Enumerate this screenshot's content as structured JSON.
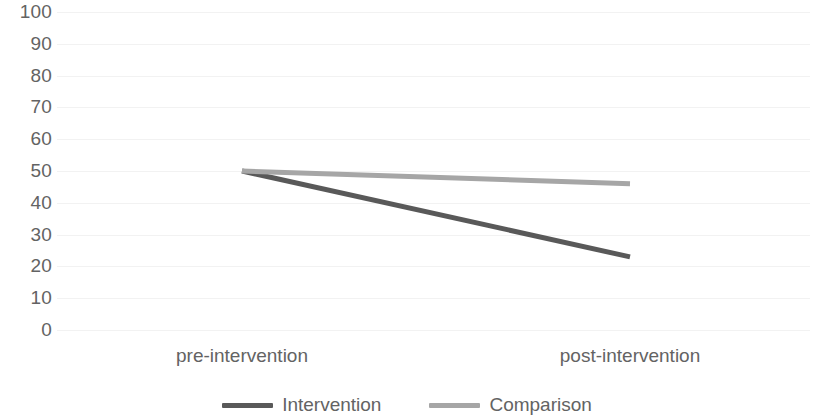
{
  "chart_data": {
    "type": "line",
    "title": "",
    "subtitle": "",
    "xlabel": "",
    "ylabel": "",
    "categories": [
      "pre-intervention",
      "post-intervention"
    ],
    "ylim": [
      0,
      100
    ],
    "y_ticks": [
      100,
      90,
      80,
      70,
      60,
      50,
      40,
      30,
      20,
      10,
      0
    ],
    "grid": true,
    "grid_axis": "y",
    "legend_position": "bottom",
    "series": [
      {
        "name": "Intervention",
        "values": [
          50,
          23
        ],
        "color": "#595959"
      },
      {
        "name": "Comparison",
        "values": [
          50,
          46
        ],
        "color": "#a6a6a6"
      }
    ]
  },
  "axes": {
    "y_tick_labels": [
      "100",
      "90",
      "80",
      "70",
      "60",
      "50",
      "40",
      "30",
      "20",
      "10",
      "0"
    ],
    "x_tick_labels": [
      "pre-intervention",
      "post-intervention"
    ]
  },
  "legend": {
    "items": [
      {
        "label": "Intervention",
        "color": "#595959"
      },
      {
        "label": "Comparison",
        "color": "#a6a6a6"
      }
    ]
  },
  "colors": {
    "background": "#ffffff",
    "gridline": "#f2f2f2",
    "tick_text": "#636363",
    "series_intervention": "#595959",
    "series_comparison": "#a6a6a6"
  }
}
